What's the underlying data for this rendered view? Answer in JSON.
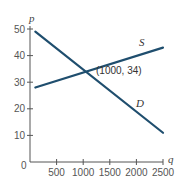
{
  "chart_data": {
    "type": "line",
    "title": "",
    "xlabel": "q",
    "ylabel": "p",
    "xlim": [
      0,
      2500
    ],
    "ylim": [
      0,
      50
    ],
    "grid": false,
    "origin_label": "0",
    "x_ticks": [
      500,
      1000,
      1500,
      2000,
      2500
    ],
    "x_tick_labels": [
      "500",
      "1000",
      "1500",
      "2000",
      "2500"
    ],
    "y_ticks": [
      10,
      20,
      30,
      40,
      50
    ],
    "y_tick_labels": [
      "10",
      "20",
      "30",
      "40",
      "50"
    ],
    "series": [
      {
        "name": "S",
        "label": "S",
        "description": "Supply",
        "x": [
          100,
          2500
        ],
        "y": [
          28,
          43
        ],
        "color": "#1f4e6e"
      },
      {
        "name": "D",
        "label": "D",
        "description": "Demand",
        "x": [
          100,
          2500
        ],
        "y": [
          49,
          11
        ],
        "color": "#1f4e6e"
      }
    ],
    "annotations": [
      {
        "text": "(1000, 34)",
        "x": 1000,
        "y": 34
      }
    ]
  },
  "labels": {
    "origin": "0",
    "x_axis_var": "q",
    "y_axis_var": "p",
    "supply": "S",
    "demand": "D",
    "equilibrium": "(1000, 34)"
  }
}
